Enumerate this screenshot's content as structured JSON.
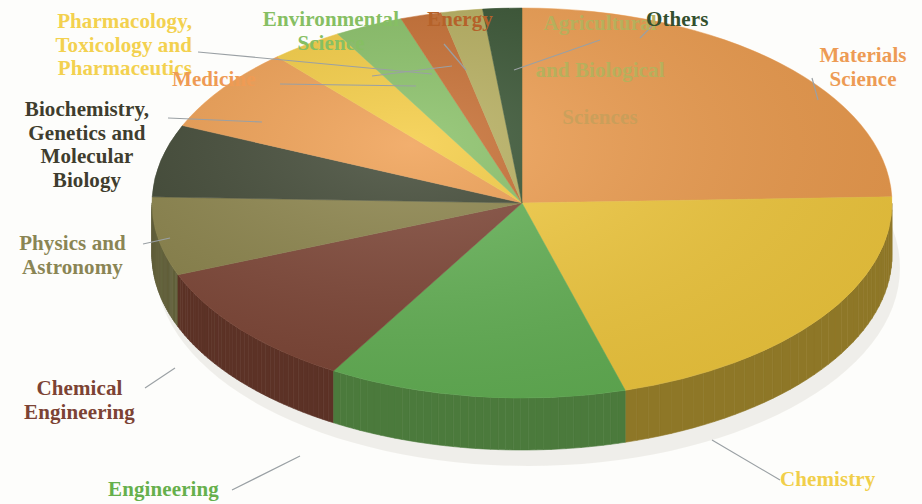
{
  "chart_data": {
    "type": "pie",
    "title": "",
    "subtitle": "",
    "xlabel": "",
    "ylabel": "",
    "legend_position": "callout-labels",
    "grid": false,
    "style": "3d-pie",
    "center": {
      "x": 522,
      "y": 203
    },
    "radius_x": 370,
    "radius_y": 195,
    "depth": 52,
    "start_angle_deg": -90,
    "direction": "clockwise",
    "categories": [
      "Materials Science",
      "Chemistry",
      "Engineering",
      "Chemical Engineering",
      "Physics and Astronomy",
      "Biochemistry, Genetics and Molecular Biology",
      "Medicine",
      "Pharmacology, Toxicology and Pharmaceutics",
      "Environmental Science",
      "Energy",
      "Agricultural and Biological Sciences",
      "Others"
    ],
    "values": [
      24.5,
      21.0,
      13.0,
      10.5,
      6.5,
      6.0,
      7.0,
      3.2,
      3.0,
      1.8,
      1.8,
      1.7
    ],
    "colors": [
      "#ef9d4e",
      "#f4cb3e",
      "#63b254",
      "#7d4434",
      "#8a8248",
      "#3c4430",
      "#ef9d4e",
      "#f4cb3e",
      "#86bf63",
      "#c56a2c",
      "#b5ad5b",
      "#33502e"
    ],
    "side_colors": [
      "#6d4c25",
      "#8e7727",
      "#4b7a3c",
      "#5c3226",
      "#62603a",
      "#2c3224",
      "#a9702f",
      "#ad9030",
      "#5f8a48",
      "#8c4b20",
      "#827c40",
      "#253a22"
    ]
  },
  "labels": {
    "pharmacology": "Pharmacology,\nToxicology and\nPharmaceutics",
    "medicine": "Medicine",
    "biochemistry": "Biochemistry,\nGenetics and\nMolecular\nBiology",
    "physics": "Physics and\nAstronomy",
    "chemical_engineering": "Chemical\nEngineering",
    "engineering": "Engineering",
    "environmental_science": "Environmental\nScience",
    "energy": "Energy",
    "agricultural_line1": "Agricultural",
    "agricultural_line2": "and Biological",
    "agricultural_line3": "Sciences",
    "others": "Others",
    "materials_science": "Materials\nScience",
    "chemistry": "Chemistry"
  }
}
